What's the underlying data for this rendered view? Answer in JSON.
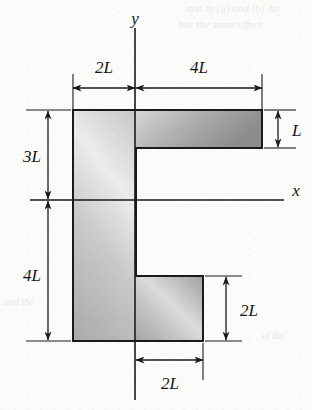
{
  "figure": {
    "kind": "engineering-cross-section",
    "axes": {
      "x_label": "x",
      "y_label": "y"
    },
    "dimensions": {
      "top_left": "2L",
      "top_right": "4L",
      "right_flange_thickness": "L",
      "left_upper": "3L",
      "left_lower": "4L",
      "bottom_block_height": "2L",
      "bottom_block_width": "2L"
    },
    "colors": {
      "outline": "#1a1a1a",
      "fill_light": "#e6e6e6",
      "fill_mid": "#b9b9b9",
      "fill_dark": "#8e8e8e",
      "paper": "#fbfbf9",
      "dimension_line": "#1a1a1a"
    },
    "bleed_through_text": [
      "and in (a) and (b) An",
      "has the same effect",
      "and the",
      "of the"
    ]
  }
}
